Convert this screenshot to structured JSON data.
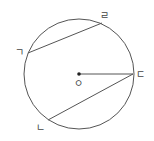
{
  "diagram": {
    "type": "circle-geometry",
    "colors": {
      "stroke": "#555555",
      "label": "#444444",
      "background": "#ffffff"
    },
    "circle": {
      "cx": 79,
      "cy": 74,
      "r": 55
    },
    "center": {
      "label": "ㅇ",
      "x": 79,
      "y": 74
    },
    "points": [
      {
        "label": "ㄱ",
        "x": 28,
        "y": 53
      },
      {
        "label": "ㄹ",
        "x": 102,
        "y": 23
      },
      {
        "label": "ㄷ",
        "x": 133,
        "y": 74
      },
      {
        "label": "ㄴ",
        "x": 48,
        "y": 120
      }
    ],
    "segments": [
      {
        "from": "ㄱ",
        "to": "ㄹ",
        "kind": "chord"
      },
      {
        "from": "ㄴ",
        "to": "ㄷ",
        "kind": "chord"
      },
      {
        "from": "ㅇ",
        "to": "ㄷ",
        "kind": "radius"
      }
    ],
    "labels": {
      "g": "ㄱ",
      "r": "ㄹ",
      "d": "ㄷ",
      "n": "ㄴ",
      "o": "ㅇ"
    }
  }
}
